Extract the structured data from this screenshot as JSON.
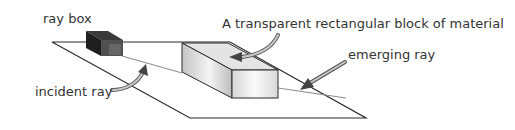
{
  "diagram": {
    "labels": {
      "ray_box": "ray box",
      "block": "A transparent rectangular block of material",
      "emerging_ray": "emerging ray",
      "incident_ray": "incident ray"
    },
    "colors": {
      "line": "#2b2b2b",
      "ray": "#8a8a8a",
      "ray_box_dark": "#2a2a2a",
      "ray_box_front": "#555555",
      "block_top": "#e6e6e6",
      "block_side": "#d0d0d0",
      "block_front": "#f2f2f2",
      "arrow_fill": "#9a9a9a",
      "text": "#333333"
    }
  }
}
